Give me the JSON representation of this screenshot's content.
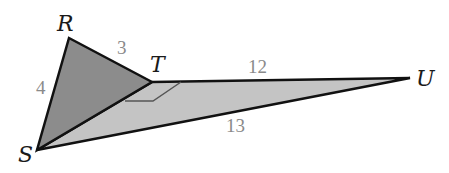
{
  "diagram": {
    "type": "geometry-figure",
    "vertices": [
      {
        "id": "R",
        "label": "R",
        "x": 69,
        "y": 38
      },
      {
        "id": "T",
        "label": "T",
        "x": 152,
        "y": 82
      },
      {
        "id": "U",
        "label": "U",
        "x": 410,
        "y": 78
      },
      {
        "id": "S",
        "label": "S",
        "x": 37,
        "y": 150
      }
    ],
    "sides": [
      {
        "from": "R",
        "to": "T",
        "length": "3"
      },
      {
        "from": "R",
        "to": "S",
        "length": "4"
      },
      {
        "from": "T",
        "to": "U",
        "length": "12"
      },
      {
        "from": "S",
        "to": "U",
        "length": "13"
      }
    ],
    "triangles": [
      {
        "name": "RST",
        "fill": "#8c8c8c"
      },
      {
        "name": "STU",
        "fill": "#c4c4c4"
      }
    ],
    "right_angle_at": "T",
    "colors": {
      "stroke": "#111111",
      "dark_fill": "#8c8c8c",
      "light_fill": "#c4c4c4",
      "length_label": "#8a8a8a"
    }
  },
  "labels": {
    "R": "R",
    "T": "T",
    "U": "U",
    "S": "S",
    "RT": "3",
    "RS": "4",
    "TU": "12",
    "SU": "13"
  }
}
